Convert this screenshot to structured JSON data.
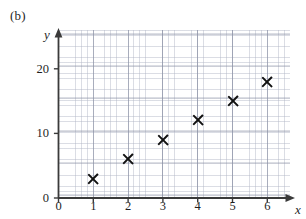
{
  "figure": {
    "part_label": "(b)"
  },
  "chart_data": {
    "type": "scatter",
    "title": "",
    "xlabel": "x",
    "ylabel": "y",
    "xlim": [
      0,
      6.6
    ],
    "ylim": [
      0,
      26
    ],
    "grid": true,
    "legend": null,
    "marker": "x-cross",
    "marker_color": "#111111",
    "x": [
      1,
      2,
      3,
      4,
      5,
      6
    ],
    "y": [
      3,
      6,
      9,
      12,
      15,
      18
    ],
    "points": [
      {
        "x": 1,
        "y": 3
      },
      {
        "x": 2,
        "y": 6
      },
      {
        "x": 3,
        "y": 9
      },
      {
        "x": 4,
        "y": 12
      },
      {
        "x": 5,
        "y": 15
      },
      {
        "x": 6,
        "y": 18
      }
    ],
    "xticks": [
      0,
      1,
      2,
      3,
      4,
      5,
      6
    ],
    "xtick_labels": [
      "0",
      "1",
      "2",
      "3",
      "4",
      "5",
      "6"
    ],
    "yticks": [
      0,
      10,
      20
    ],
    "ytick_labels": [
      "0",
      "10",
      "20"
    ],
    "y_minor_tick_step": 5,
    "axis_arrows": true,
    "grid_color": "#aeb4c4",
    "axis_color": "#3a3a3a"
  }
}
